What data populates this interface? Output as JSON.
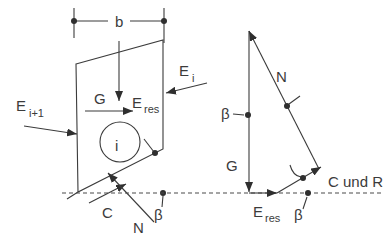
{
  "colors": {
    "line": "#3b3b3b",
    "background": "#ffffff"
  },
  "slice_diagram": {
    "width_dimension": "b",
    "weight": "G",
    "resultant_main": "E",
    "resultant_sub": "res",
    "interslice_right_main": "E",
    "interslice_right_sub": "i",
    "interslice_left_main": "E",
    "interslice_left_sub": "i+1",
    "slice_index": "i",
    "cohesion": "C",
    "normal": "N",
    "base_angle": "β"
  },
  "force_polygon": {
    "normal": "N",
    "weight": "G",
    "angle_at_weight": "β",
    "angle_at_base": "β",
    "resultant_main": "E",
    "resultant_sub": "res",
    "closing_force": "C und R"
  }
}
